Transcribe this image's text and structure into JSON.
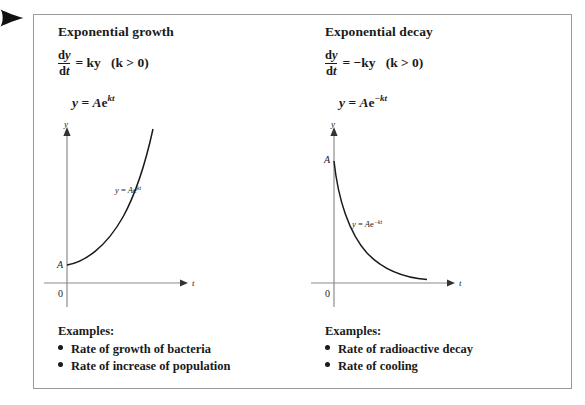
{
  "pointer": {
    "icon": "right-arrowhead-icon"
  },
  "panel": {
    "columns": [
      {
        "id": "growth",
        "heading": "Exponential growth",
        "equation_derivative": {
          "fraction_numerator": "dy",
          "fraction_denominator": "dt",
          "right_side": "= ky",
          "condition": "(k > 0)"
        },
        "equation_solution": {
          "lhs": "y =",
          "base": "Ae",
          "exponent": "kt"
        },
        "graph": {
          "y_axis_label": "y",
          "x_axis_label": "t",
          "origin_label": "0",
          "intercept_label": "A",
          "curve_label_lhs": "y = Ae",
          "curve_label_exponent": "kt",
          "curve_type": "exponential-growth"
        },
        "examples_title": "Examples:",
        "examples": [
          "Rate of growth of bacteria",
          "Rate of increase of population"
        ]
      },
      {
        "id": "decay",
        "heading": "Exponential decay",
        "equation_derivative": {
          "fraction_numerator": "dy",
          "fraction_denominator": "dt",
          "right_side": "= −ky",
          "condition": "(k > 0)"
        },
        "equation_solution": {
          "lhs": "y =",
          "base": "Ae",
          "exponent": "−kt"
        },
        "graph": {
          "y_axis_label": "y",
          "x_axis_label": "t",
          "origin_label": "0",
          "intercept_label": "A",
          "curve_label_lhs": "y = Ae",
          "curve_label_exponent": "−kt",
          "curve_type": "exponential-decay"
        },
        "examples_title": "Examples:",
        "examples": [
          "Rate of radioactive decay",
          "Rate of cooling"
        ]
      }
    ]
  },
  "colors": {
    "ink": "#1a1a1a",
    "border": "#9a9a9a",
    "background": "#ffffff"
  }
}
